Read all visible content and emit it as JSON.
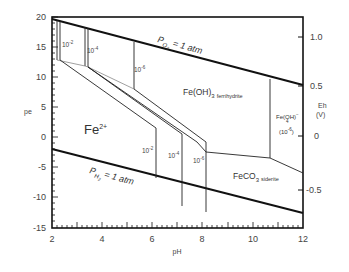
{
  "diagram": {
    "type": "pe-pH predominance diagram",
    "x_axis": {
      "label": "pH",
      "ticks": [
        "2",
        "4",
        "6",
        "8",
        "10",
        "12"
      ],
      "range": [
        2,
        12
      ]
    },
    "y_axis_left": {
      "label": "pe",
      "ticks": [
        "20",
        "15",
        "10",
        "5",
        "0",
        "-5",
        "-10",
        "-15"
      ],
      "range": [
        -15,
        20
      ]
    },
    "y_axis_right": {
      "label_line1": "Eh",
      "label_line2": "(V)",
      "ticks": [
        "1.0",
        "0.5",
        "0",
        "-0.5"
      ]
    },
    "regions": {
      "fe2": {
        "base": "Fe",
        "sup": "2+"
      },
      "ferrihydrite": {
        "base": "Fe(OH)",
        "sub": "3",
        "name": "ferrihydrite"
      },
      "ferrate": {
        "base": "Fe(OH)",
        "sup": "−",
        "sub": "4",
        "conc_base": "(10",
        "conc_sup": "-6",
        "conc_end": ")"
      },
      "siderite": {
        "base": "FeCO",
        "sub": "3",
        "name": "siderite"
      }
    },
    "boundaries": {
      "o2": {
        "base": "P",
        "sub": "O",
        "subsub": "2",
        "rest": " = 1 atm"
      },
      "h2": {
        "base": "P",
        "sub": "H",
        "subsub": "2",
        "rest": " = 1 atm"
      }
    },
    "concentration_labels": [
      {
        "base": "10",
        "sup": "-2"
      },
      {
        "base": "10",
        "sup": "-4"
      },
      {
        "base": "10",
        "sup": "-6"
      },
      {
        "base": "10",
        "sup": "-2"
      },
      {
        "base": "10",
        "sup": "-4"
      },
      {
        "base": "10",
        "sup": "-6"
      }
    ]
  }
}
